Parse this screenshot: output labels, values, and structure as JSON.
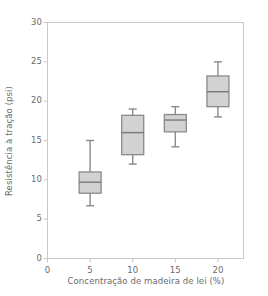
{
  "chart_data": {
    "type": "box",
    "title": "",
    "xlabel": "Concentração de madeira de lei (%)",
    "ylabel": "Resistência à tração (psi)",
    "xlim": [
      0,
      23
    ],
    "ylim": [
      0,
      30
    ],
    "xticks": [
      0,
      5,
      10,
      15,
      20
    ],
    "xtick_labels": [
      "0",
      "5",
      "10",
      "15",
      "20"
    ],
    "yticks": [
      0,
      5,
      10,
      15,
      20,
      25,
      30
    ],
    "ytick_labels": [
      "0",
      "5",
      "10",
      "15",
      "20",
      "25",
      "30"
    ],
    "grid": false,
    "legend": null,
    "categories": [
      5,
      10,
      15,
      20
    ],
    "boxes": [
      {
        "category": "5",
        "x": 5,
        "whisker_low": 6.7,
        "q1": 8.3,
        "median": 9.7,
        "q3": 11.0,
        "whisker_high": 15.0
      },
      {
        "category": "10",
        "x": 10,
        "whisker_low": 12.0,
        "q1": 13.2,
        "median": 16.0,
        "q3": 18.2,
        "whisker_high": 19.0
      },
      {
        "category": "15",
        "x": 15,
        "whisker_low": 14.2,
        "q1": 16.1,
        "median": 17.6,
        "q3": 18.3,
        "whisker_high": 19.3
      },
      {
        "category": "20",
        "x": 20,
        "whisker_low": 18.0,
        "q1": 19.3,
        "median": 21.2,
        "q3": 23.2,
        "whisker_high": 25.0
      }
    ],
    "colors": {
      "box_fill": "#d2d2d2",
      "box_edge": "#8a8a8a",
      "whisker": "#8a8a8a",
      "median": "#7a7a7a",
      "axis": "#c9c9c9",
      "tick_text": "#6b6b6b",
      "background": "#ffffff"
    }
  }
}
